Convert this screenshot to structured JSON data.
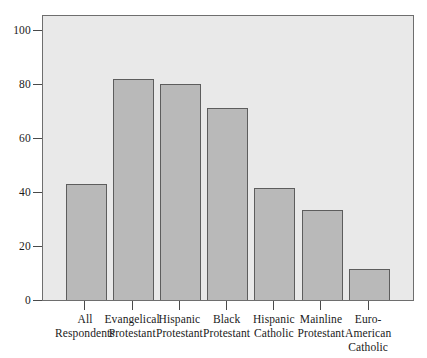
{
  "chart_data": {
    "type": "bar",
    "title": "",
    "subtitle": "",
    "xlabel": "",
    "ylabel": "",
    "ylim": [
      0,
      100
    ],
    "yticks": [
      0,
      20,
      40,
      60,
      80,
      100
    ],
    "ytick_labels": [
      "0",
      "20",
      "40",
      "60",
      "80",
      "100"
    ],
    "grid": false,
    "legend": "none",
    "categories": [
      "All\nRespondents",
      "Evangelical\nProtestant",
      "Hispanic\nProtestant",
      "Black\nProtestant",
      "Hispanic\nCatholic",
      "Mainline\nProtestant",
      "Euro-\nAmerican\nCatholic"
    ],
    "values": [
      43,
      82,
      80,
      71,
      41.5,
      33.5,
      11.5
    ],
    "colors": {
      "bar_fill": "#b9b9b9",
      "bar_edge": "#5d5d5d",
      "plot_background": "#e9e9e9",
      "frame": "#6e6e6e",
      "axis": "#4a4a4a",
      "text": "#1a1a1a",
      "page_background": "#ffffff"
    }
  }
}
